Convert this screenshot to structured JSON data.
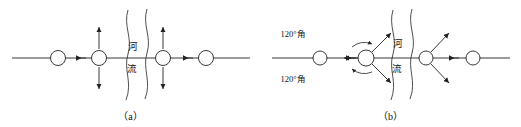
{
  "figure": {
    "type": "diagram",
    "background_color": "#ffffff",
    "line_color": "#222222"
  },
  "panels": [
    {
      "id": "a",
      "caption": "（a）",
      "river_label": "河流",
      "river_label_chars": [
        "河",
        "流"
      ],
      "baseline": {
        "y": 58,
        "x_start": 12,
        "x_end": 250
      },
      "nodes": [
        {
          "index": 1,
          "cx": 58,
          "cy": 58,
          "r": 7.5,
          "arrows": []
        },
        {
          "index": 2,
          "cx": 99,
          "cy": 58,
          "r": 7.5,
          "arrows": [
            "up",
            "down"
          ]
        },
        {
          "index": 3,
          "cx": 163,
          "cy": 58,
          "r": 7.5,
          "arrows": [
            "up",
            "down"
          ]
        },
        {
          "index": 4,
          "cx": 206,
          "cy": 58,
          "r": 7.5,
          "arrows": []
        }
      ],
      "inline_arrows": [
        {
          "x": 79,
          "y": 58,
          "direction": "left"
        },
        {
          "x": 186,
          "y": 58,
          "direction": "left"
        }
      ],
      "river_waves": [
        {
          "x_top": 128,
          "x_bottom": 122
        },
        {
          "x_top": 146,
          "x_bottom": 140
        }
      ]
    },
    {
      "id": "b",
      "caption": "（b）",
      "river_label": "河流",
      "river_label_chars": [
        "河",
        "流"
      ],
      "angle_labels": [
        {
          "text": "120°角",
          "x": 33,
          "y": 34,
          "position": "upper-left"
        },
        {
          "text": "120°角",
          "x": 33,
          "y": 78,
          "position": "lower-left"
        }
      ],
      "baseline": {
        "y": 58,
        "x_start": 12,
        "x_end": 250
      },
      "nodes": [
        {
          "index": 1,
          "cx": 60,
          "cy": 58,
          "r": 7.0,
          "arrows": []
        },
        {
          "index": 2,
          "cx": 106,
          "cy": 58,
          "r": 8.0,
          "arrows": [
            "up-right-120",
            "down-right-120",
            "left-120"
          ],
          "arcs": true
        },
        {
          "index": 3,
          "cx": 166,
          "cy": 58,
          "r": 7.0,
          "arrows": [
            "up-right-120",
            "down-right-120"
          ]
        },
        {
          "index": 4,
          "cx": 213,
          "cy": 58,
          "r": 7.0,
          "arrows": []
        }
      ],
      "inline_arrows": [
        {
          "x": 89,
          "y": 58,
          "direction": "left"
        },
        {
          "x": 192,
          "y": 58,
          "direction": "left"
        }
      ],
      "river_waves": [
        {
          "x_top": 133,
          "x_bottom": 127
        },
        {
          "x_top": 151,
          "x_bottom": 145
        }
      ]
    }
  ]
}
